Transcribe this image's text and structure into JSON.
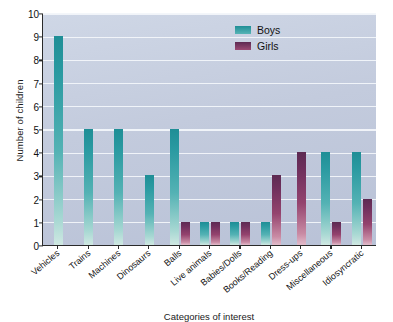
{
  "chart_data": {
    "type": "bar",
    "title": "",
    "xlabel": "Categories of interest",
    "ylabel": "Number of children",
    "ylim": [
      0,
      10
    ],
    "yticks": [
      0,
      1,
      2,
      3,
      4,
      5,
      6,
      7,
      8,
      9,
      10
    ],
    "grid": true,
    "legend_position": "top-right",
    "categories": [
      "Vehicles",
      "Trains",
      "Machines",
      "Dinosaurs",
      "Balls",
      "Live animals",
      "Babies/Dolls",
      "Books/Reading",
      "Dress-ups",
      "Miscellaneous",
      "Idiosyncratic"
    ],
    "series": [
      {
        "name": "Boys",
        "color": "#2a9aa1",
        "values": [
          9,
          5,
          5,
          3,
          5,
          1,
          1,
          1,
          0,
          4,
          4
        ]
      },
      {
        "name": "Girls",
        "color": "#6e2f5c",
        "values": [
          0,
          0,
          0,
          0,
          1,
          1,
          1,
          3,
          4,
          1,
          2
        ]
      }
    ]
  },
  "legend": {
    "items": [
      {
        "label": "Boys",
        "color": "#2a9aa1"
      },
      {
        "label": "Girls",
        "color": "#6e2f5c"
      }
    ]
  },
  "axes": {
    "y_title": "Number of children",
    "x_title": "Categories of interest"
  }
}
